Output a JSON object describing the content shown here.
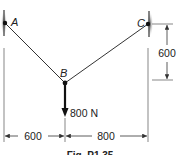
{
  "figure": {
    "points": {
      "A": {
        "label": "A"
      },
      "B": {
        "label": "B"
      },
      "C": {
        "label": "C"
      }
    },
    "load": {
      "label": "800 N"
    },
    "dimensions": {
      "horizontal_left": "600",
      "horizontal_right": "800",
      "vertical_right": "600"
    },
    "caption": "Fig. P1.35"
  },
  "colors": {
    "line": "#333333",
    "wall": "#666666"
  }
}
